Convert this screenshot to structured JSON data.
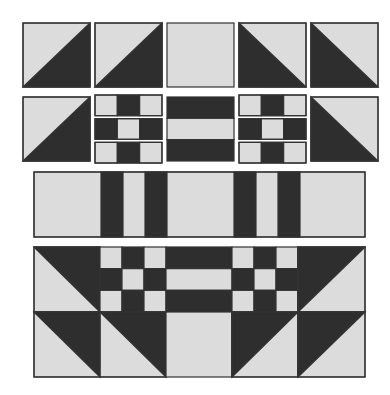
{
  "colors": {
    "light": "#dcdcdc",
    "dark": "#2e2e2e",
    "stroke": "#333333",
    "background": "#ffffff"
  },
  "rows": [
    {
      "name": "row-1-units",
      "blocks": [
        {
          "name": "hst-block-1",
          "type": "hst",
          "x": 23,
          "y": 23,
          "w": 67,
          "h": 64,
          "dark": "bottom-right"
        },
        {
          "name": "hst-block-2",
          "type": "hst",
          "x": 95,
          "y": 23,
          "w": 67,
          "h": 64,
          "dark": "bottom-right"
        },
        {
          "name": "plain-light-square",
          "type": "plain",
          "x": 167,
          "y": 23,
          "w": 67,
          "h": 64
        },
        {
          "name": "hst-block-3",
          "type": "hst",
          "x": 239,
          "y": 23,
          "w": 67,
          "h": 64,
          "dark": "bottom-left"
        },
        {
          "name": "hst-block-4",
          "type": "hst",
          "x": 311,
          "y": 23,
          "w": 67,
          "h": 64,
          "dark": "bottom-left"
        }
      ]
    },
    {
      "name": "row-2-units",
      "blocks": [
        {
          "name": "hst-block-5",
          "type": "hst",
          "x": 23,
          "y": 97,
          "w": 67,
          "h": 64,
          "dark": "bottom-right"
        },
        {
          "name": "nine-patch-strips-left",
          "type": "strips",
          "x": 95,
          "y": 95,
          "w": 67,
          "h": 68,
          "pattern": [
            [
              "L",
              "D",
              "L"
            ],
            [
              "D",
              "L",
              "D"
            ],
            [
              "L",
              "D",
              "L"
            ]
          ]
        },
        {
          "name": "rail-fence-block",
          "type": "rail",
          "x": 167,
          "y": 97,
          "w": 67,
          "h": 64,
          "pattern": [
            "D",
            "L",
            "D"
          ]
        },
        {
          "name": "nine-patch-strips-right",
          "type": "strips",
          "x": 239,
          "y": 95,
          "w": 67,
          "h": 68,
          "pattern": [
            [
              "L",
              "D",
              "L"
            ],
            [
              "D",
              "L",
              "D"
            ],
            [
              "L",
              "D",
              "L"
            ]
          ]
        },
        {
          "name": "hst-block-6",
          "type": "hst",
          "x": 311,
          "y": 97,
          "w": 67,
          "h": 64,
          "dark": "bottom-left"
        }
      ]
    },
    {
      "name": "row-3-sashing",
      "blocks": [
        {
          "name": "sashing-strip",
          "type": "bars",
          "x": 34,
          "y": 172,
          "w": 331,
          "h": 65,
          "bars": [
            [
              67,
              89
            ],
            [
              111,
              133
            ],
            [
              200,
              222
            ],
            [
              244,
              266
            ]
          ]
        }
      ]
    },
    {
      "name": "row-4-assembled",
      "blocks": [
        {
          "name": "assembled-top-left-hst",
          "type": "hst",
          "x": 34,
          "y": 247,
          "w": 66,
          "h": 65,
          "dark": "top-right"
        },
        {
          "name": "assembled-nine-patch-left",
          "type": "grid",
          "x": 100,
          "y": 247,
          "w": 66,
          "h": 65,
          "pattern": [
            [
              "L",
              "D",
              "L"
            ],
            [
              "D",
              "L",
              "D"
            ],
            [
              "L",
              "D",
              "L"
            ]
          ]
        },
        {
          "name": "assembled-rail-fence",
          "type": "rail",
          "x": 166,
          "y": 247,
          "w": 66,
          "h": 65,
          "pattern": [
            "D",
            "L",
            "D"
          ]
        },
        {
          "name": "assembled-nine-patch-right",
          "type": "grid",
          "x": 232,
          "y": 247,
          "w": 66,
          "h": 65,
          "pattern": [
            [
              "L",
              "D",
              "L"
            ],
            [
              "D",
              "L",
              "D"
            ],
            [
              "L",
              "D",
              "L"
            ]
          ]
        },
        {
          "name": "assembled-top-right-hst",
          "type": "hst",
          "x": 298,
          "y": 247,
          "w": 67,
          "h": 65,
          "dark": "top-left"
        },
        {
          "name": "assembled-bottom-hst-1",
          "type": "hst",
          "x": 34,
          "y": 312,
          "w": 66,
          "h": 65,
          "dark": "top-right"
        },
        {
          "name": "assembled-bottom-hst-2",
          "type": "hst",
          "x": 100,
          "y": 312,
          "w": 66,
          "h": 65,
          "dark": "top-right"
        },
        {
          "name": "assembled-bottom-plain",
          "type": "plain",
          "x": 166,
          "y": 312,
          "w": 66,
          "h": 65
        },
        {
          "name": "assembled-bottom-hst-3",
          "type": "hst",
          "x": 232,
          "y": 312,
          "w": 66,
          "h": 65,
          "dark": "top-left"
        },
        {
          "name": "assembled-bottom-hst-4",
          "type": "hst",
          "x": 298,
          "y": 312,
          "w": 67,
          "h": 65,
          "dark": "top-left"
        }
      ]
    }
  ]
}
